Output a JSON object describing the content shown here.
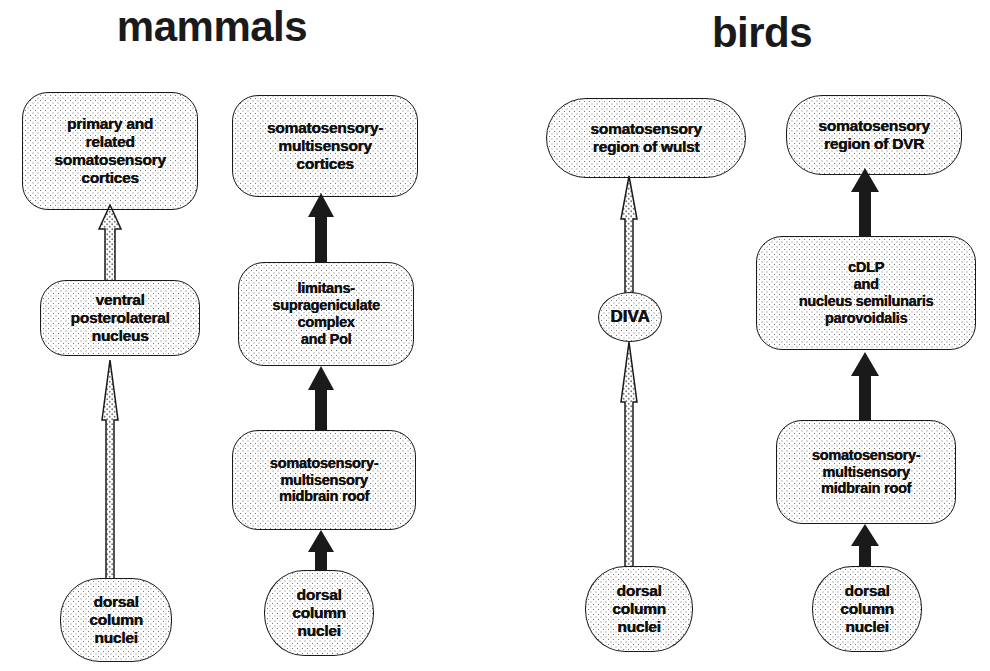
{
  "diagram": {
    "title_left": "mammals",
    "title_right": "birds",
    "groups": [
      {
        "name": "mammals",
        "label": "mammals",
        "columns": [
          {
            "name": "mammal-lemniscal-pathway",
            "nodes": [
              {
                "id": "m1-cortex",
                "label": "primary and\nrelated\nsomatosensory\ncortices"
              },
              {
                "id": "m1-vpl",
                "label": "ventral\nposterolateral\nnucleus"
              },
              {
                "id": "m1-dcn",
                "label": "dorsal\ncolumn\nnuclei"
              }
            ],
            "arrows": [
              {
                "from": "m1-dcn",
                "to": "m1-vpl",
                "style": "open"
              },
              {
                "from": "m1-vpl",
                "to": "m1-cortex",
                "style": "open"
              }
            ]
          },
          {
            "name": "mammal-collicular-pathway",
            "nodes": [
              {
                "id": "m2-cortex",
                "label": "somatosensory-\nmultisensory\ncortices"
              },
              {
                "id": "m2-limitans",
                "label": "limitans-\nsuprageniculate\ncomplex\nand Pol"
              },
              {
                "id": "m2-midbrain",
                "label": "somatosensory-\nmultisensory\nmidbrain roof"
              },
              {
                "id": "m2-dcn",
                "label": "dorsal\ncolumn\nnuclei"
              }
            ],
            "arrows": [
              {
                "from": "m2-dcn",
                "to": "m2-midbrain",
                "style": "solid"
              },
              {
                "from": "m2-midbrain",
                "to": "m2-limitans",
                "style": "solid"
              },
              {
                "from": "m2-limitans",
                "to": "m2-cortex",
                "style": "solid"
              }
            ]
          }
        ]
      },
      {
        "name": "birds",
        "label": "birds",
        "columns": [
          {
            "name": "bird-lemniscal-pathway",
            "nodes": [
              {
                "id": "b1-wulst",
                "label": "somatosensory\nregion of wulst"
              },
              {
                "id": "b1-diva",
                "label": "DIVA"
              },
              {
                "id": "b1-dcn",
                "label": "dorsal\ncolumn\nnuclei"
              }
            ],
            "arrows": [
              {
                "from": "b1-dcn",
                "to": "b1-diva",
                "style": "open"
              },
              {
                "from": "b1-diva",
                "to": "b1-wulst",
                "style": "open"
              }
            ]
          },
          {
            "name": "bird-collicular-pathway",
            "nodes": [
              {
                "id": "b2-dvr",
                "label": "somatosensory\nregion of DVR"
              },
              {
                "id": "b2-cdlp",
                "label": "cDLP\nand\nnucleus semilunaris\nparovoidalis"
              },
              {
                "id": "b2-midbrain",
                "label": "somatosensory-\nmultisensory\nmidbrain roof"
              },
              {
                "id": "b2-dcn",
                "label": "dorsal\ncolumn\nnuclei"
              }
            ],
            "arrows": [
              {
                "from": "b2-dcn",
                "to": "b2-midbrain",
                "style": "solid"
              },
              {
                "from": "b2-midbrain",
                "to": "b2-cdlp",
                "style": "solid"
              },
              {
                "from": "b2-cdlp",
                "to": "b2-dvr",
                "style": "solid"
              }
            ]
          }
        ]
      }
    ],
    "colors": {
      "ink": "#1a1a1a",
      "stipple": "#767676",
      "background": "#ffffff",
      "solid_arrow": "#1a1a1a",
      "open_arrow_fill": "#ffffff"
    }
  }
}
